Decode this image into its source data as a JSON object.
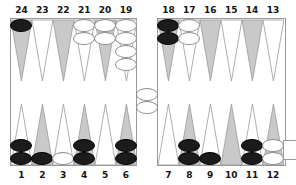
{
  "app": {
    "title": "Backgammon Board",
    "view": "board-diagram"
  },
  "colors": {
    "dark_checker": "#1b1b1b",
    "light_checker": "#ffffff",
    "point_shaded": "#c9c9c9",
    "point_plain": "#ffffff",
    "point_outline": "#9a9a9a",
    "frame": "#9a9a9a",
    "label_text": "#141414",
    "background": "#ffffff"
  },
  "board": {
    "top_labels": [
      "24",
      "23",
      "22",
      "21",
      "20",
      "19",
      "18",
      "17",
      "16",
      "15",
      "14",
      "13"
    ],
    "bottom_labels": [
      "1",
      "2",
      "3",
      "4",
      "5",
      "6",
      "7",
      "8",
      "9",
      "10",
      "11",
      "12"
    ],
    "bar": {
      "label": "bar",
      "checkers": [
        {
          "color": "light"
        },
        {
          "color": "light"
        }
      ],
      "light_count": 2,
      "dark_count": 0
    },
    "bearoff_tray": {
      "label": "",
      "count": 0
    },
    "points": [
      {
        "number": "24",
        "row": "top",
        "index": 0,
        "shaded": true,
        "color": "dark",
        "count": 1
      },
      {
        "number": "23",
        "row": "top",
        "index": 1,
        "shaded": false,
        "color": "",
        "count": 0
      },
      {
        "number": "22",
        "row": "top",
        "index": 2,
        "shaded": true,
        "color": "",
        "count": 0
      },
      {
        "number": "21",
        "row": "top",
        "index": 3,
        "shaded": false,
        "color": "light",
        "count": 2
      },
      {
        "number": "20",
        "row": "top",
        "index": 4,
        "shaded": true,
        "color": "light",
        "count": 2
      },
      {
        "number": "19",
        "row": "top",
        "index": 5,
        "shaded": false,
        "color": "light",
        "count": 4
      },
      {
        "number": "18",
        "row": "top",
        "index": 6,
        "shaded": true,
        "color": "dark",
        "count": 2
      },
      {
        "number": "17",
        "row": "top",
        "index": 7,
        "shaded": false,
        "color": "light",
        "count": 2
      },
      {
        "number": "16",
        "row": "top",
        "index": 8,
        "shaded": true,
        "color": "",
        "count": 0
      },
      {
        "number": "15",
        "row": "top",
        "index": 9,
        "shaded": false,
        "color": "",
        "count": 0
      },
      {
        "number": "14",
        "row": "top",
        "index": 10,
        "shaded": true,
        "color": "",
        "count": 0
      },
      {
        "number": "13",
        "row": "top",
        "index": 11,
        "shaded": false,
        "color": "",
        "count": 0
      },
      {
        "number": "1",
        "row": "bottom",
        "index": 0,
        "shaded": false,
        "color": "dark",
        "count": 2
      },
      {
        "number": "2",
        "row": "bottom",
        "index": 1,
        "shaded": true,
        "color": "dark",
        "count": 1
      },
      {
        "number": "3",
        "row": "bottom",
        "index": 2,
        "shaded": false,
        "color": "light",
        "count": 1
      },
      {
        "number": "4",
        "row": "bottom",
        "index": 3,
        "shaded": true,
        "color": "dark",
        "count": 2
      },
      {
        "number": "5",
        "row": "bottom",
        "index": 4,
        "shaded": false,
        "color": "",
        "count": 0
      },
      {
        "number": "6",
        "row": "bottom",
        "index": 5,
        "shaded": true,
        "color": "dark",
        "count": 2
      },
      {
        "number": "7",
        "row": "bottom",
        "index": 6,
        "shaded": false,
        "color": "",
        "count": 0
      },
      {
        "number": "8",
        "row": "bottom",
        "index": 7,
        "shaded": true,
        "color": "dark",
        "count": 2
      },
      {
        "number": "9",
        "row": "bottom",
        "index": 8,
        "shaded": false,
        "color": "dark",
        "count": 1
      },
      {
        "number": "10",
        "row": "bottom",
        "index": 9,
        "shaded": true,
        "color": "",
        "count": 0
      },
      {
        "number": "11",
        "row": "bottom",
        "index": 10,
        "shaded": false,
        "color": "dark",
        "count": 2
      },
      {
        "number": "12",
        "row": "bottom",
        "index": 11,
        "shaded": true,
        "color": "light",
        "count": 2
      }
    ]
  }
}
